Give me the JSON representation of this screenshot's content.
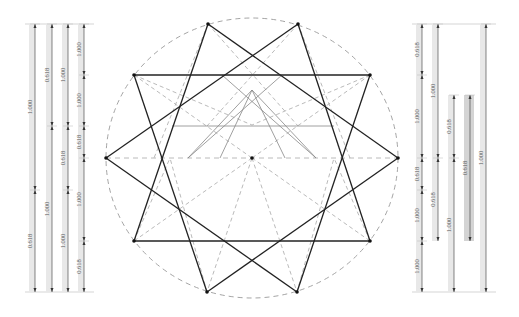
{
  "diagram": {
    "title": "",
    "circle": {
      "cx": 252,
      "cy": 158,
      "rx": 146,
      "ry": 140,
      "stroke": "#9a9a9a"
    },
    "center_point": {
      "x": 252,
      "y": 158
    },
    "outer_vertices": [
      [
        208,
        24
      ],
      [
        298,
        24
      ],
      [
        370,
        75
      ],
      [
        398,
        158
      ],
      [
        370,
        241
      ],
      [
        297,
        292
      ],
      [
        207,
        292
      ],
      [
        134,
        241
      ],
      [
        106,
        158
      ],
      [
        134,
        75
      ]
    ],
    "colors": {
      "bold": "#222222",
      "thin": "#888888",
      "dashed": "#a8a8a8",
      "band": "#e8e8e8",
      "band_dark": "#d4d4d4",
      "dim": "#333333"
    },
    "left_measures": {
      "top": 24,
      "bottom": 292,
      "columns": [
        {
          "x": 35,
          "segments": [
            {
              "from": 24,
              "to": 190,
              "label": "1.000"
            },
            {
              "from": 190,
              "to": 292,
              "label": "0.618"
            }
          ]
        },
        {
          "x": 52,
          "segments": [
            {
              "from": 24,
              "to": 126,
              "label": "0.618"
            },
            {
              "from": 126,
              "to": 292,
              "label": "1.000"
            }
          ]
        },
        {
          "x": 68,
          "segments": [
            {
              "from": 24,
              "to": 126,
              "label": "1.000"
            },
            {
              "from": 126,
              "to": 190,
              "label": "0.618"
            },
            {
              "from": 190,
              "to": 292,
              "label": "1.000"
            }
          ]
        },
        {
          "x": 84,
          "segments": [
            {
              "from": 24,
              "to": 75,
              "label": "1.000"
            },
            {
              "from": 75,
              "to": 126,
              "label": "1.000"
            },
            {
              "from": 126,
              "to": 158,
              "label": "0.618"
            },
            {
              "from": 158,
              "to": 241,
              "label": "1.000"
            },
            {
              "from": 241,
              "to": 292,
              "label": "0.618"
            }
          ]
        }
      ]
    },
    "right_measures": {
      "top": 24,
      "bottom": 292,
      "columns": [
        {
          "x": 422,
          "segments": [
            {
              "from": 24,
              "to": 75,
              "label": "0.618"
            },
            {
              "from": 75,
              "to": 158,
              "label": "1.000"
            },
            {
              "from": 158,
              "to": 190,
              "label": "0.618"
            },
            {
              "from": 190,
              "to": 241,
              "label": "1.000"
            },
            {
              "from": 241,
              "to": 292,
              "label": "1.000"
            }
          ]
        },
        {
          "x": 438,
          "segments": [
            {
              "from": 24,
              "to": 158,
              "label": "1.000"
            },
            {
              "from": 158,
              "to": 241,
              "label": "0.618"
            }
          ]
        },
        {
          "x": 454,
          "segments": [
            {
              "from": 95,
              "to": 158,
              "label": "0.618"
            },
            {
              "from": 158,
              "to": 292,
              "label": "1.000"
            }
          ]
        },
        {
          "x": 470,
          "shaded": true,
          "segments": [
            {
              "from": 95,
              "to": 241,
              "label": "0.618"
            }
          ]
        },
        {
          "x": 486,
          "segments": [
            {
              "from": 24,
              "to": 292,
              "label": "1.000"
            }
          ]
        }
      ]
    }
  }
}
